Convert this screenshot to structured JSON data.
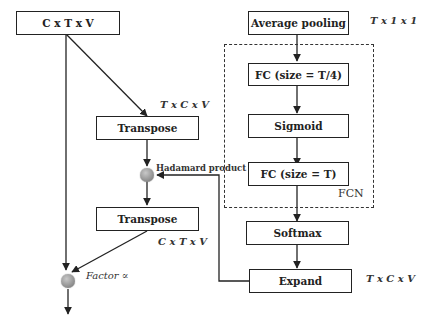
{
  "diagram": {
    "left_branch": {
      "input_box": "C x T x V",
      "transpose_top": "Transpose",
      "transpose_top_dims": "T x C x V",
      "hadamard_label": "Hadamard product",
      "transpose_bottom": "Transpose",
      "transpose_bottom_dims": "C x T x V",
      "factor_label": "Factor ∝"
    },
    "right_branch": {
      "average_pooling": "Average pooling",
      "average_pooling_dims": "T x 1 x 1",
      "fc1": "FC (size = T/4)",
      "sigmoid": "Sigmoid",
      "fc2": "FC (size  = T)",
      "fcn_label": "FCN",
      "softmax": "Softmax",
      "expand": "Expand",
      "expand_dims": "T x C x V"
    },
    "colors": {
      "line": "#222222",
      "node": "#8a8a8a",
      "background": "#ffffff"
    }
  }
}
